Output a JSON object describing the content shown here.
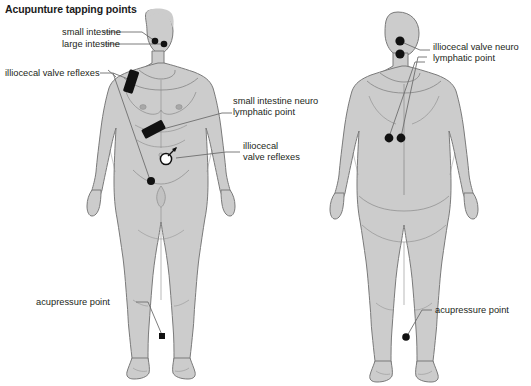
{
  "diagram": {
    "title": "Acupunture tapping points",
    "background_color": "#ffffff",
    "body_fill_color": "#cccccc",
    "body_outline_color": "#7a7a7a",
    "marker_color": "#111111",
    "leader_line_color": "#6e6e6e",
    "text_color": "#231f20"
  },
  "labels": {
    "small_intestine": "small intestine",
    "large_intestine": "large intestine",
    "illiocecal_valve_reflexes_left": "illiocecal valve reflexes",
    "small_intestine_neuro_lymphatic_line1": "small intestine neuro",
    "small_intestine_neuro_lymphatic_line2": "lymphatic point",
    "illiocecal_valve_reflexes_right_line1": "illiocecal",
    "illiocecal_valve_reflexes_right_line2": "valve reflexes",
    "illiocecal_valve_neuro_lymphatic_line1": "illiocecal valve neuro",
    "illiocecal_valve_neuro_lymphatic_line2": "lymphatic point",
    "acupressure_point_front": "acupressure point",
    "acupressure_point_back": "acupressure point"
  },
  "figures": {
    "front": {
      "name": "anterior-body-figure",
      "view": "front",
      "markers": [
        {
          "name": "small-intestine-face-point",
          "shape": "dot",
          "x": 155,
          "y": 41
        },
        {
          "name": "large-intestine-face-point",
          "shape": "dot",
          "x": 164,
          "y": 44
        },
        {
          "name": "illiocecal-valve-reflex-chest-bar",
          "shape": "bar",
          "x": 133,
          "y": 82
        },
        {
          "name": "small-intestine-neuro-lymphatic-bar",
          "shape": "bar",
          "x": 156,
          "y": 129
        },
        {
          "name": "illiocecal-valve-reflex-circle",
          "shape": "circle-arrow",
          "x": 168,
          "y": 159
        },
        {
          "name": "illiocecal-valve-reflex-groin-dot",
          "shape": "dot",
          "x": 151,
          "y": 181
        },
        {
          "name": "acupressure-point-ankle",
          "shape": "square",
          "x": 162,
          "y": 336
        }
      ]
    },
    "back": {
      "name": "posterior-body-figure",
      "view": "back",
      "markers": [
        {
          "name": "illiocecal-valve-neuro-lymphatic-neck-upper",
          "shape": "dot",
          "x": 400,
          "y": 41
        },
        {
          "name": "illiocecal-valve-neuro-lymphatic-neck-lower",
          "shape": "dot",
          "x": 400,
          "y": 54
        },
        {
          "name": "illiocecal-valve-neuro-lymphatic-back-left",
          "shape": "dot",
          "x": 389,
          "y": 138
        },
        {
          "name": "illiocecal-valve-neuro-lymphatic-back-right",
          "shape": "dot",
          "x": 401,
          "y": 138
        },
        {
          "name": "acupressure-point-ankle",
          "shape": "dot",
          "x": 406,
          "y": 337
        }
      ]
    }
  }
}
